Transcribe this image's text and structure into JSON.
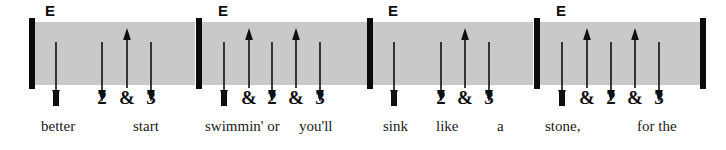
{
  "document": {
    "type": "strumming-pattern-notation",
    "width": 726,
    "height": 150,
    "band_color": "#c9c9c9",
    "ink_color": "#101010",
    "page_background": "#ffffff"
  },
  "measures": [
    {
      "id": "measure-1",
      "chord": "E",
      "chord_x": 45,
      "barline_x": 29,
      "band_start": 35,
      "band_end": 195,
      "strums": [
        {
          "beat_label": "1",
          "direction": "down",
          "x": 56,
          "is_downbeat_mark": true
        },
        {
          "beat_label": "2",
          "direction": "down",
          "x": 102,
          "is_downbeat_mark": false
        },
        {
          "beat_label": "&",
          "direction": "up",
          "x": 127,
          "is_downbeat_mark": false
        },
        {
          "beat_label": "3",
          "direction": "down",
          "x": 151,
          "is_downbeat_mark": false
        }
      ],
      "lyrics": [
        {
          "text": "better",
          "x": 41
        },
        {
          "text": "start",
          "x": 133
        }
      ]
    },
    {
      "id": "measure-2",
      "chord": "E",
      "chord_x": 218,
      "barline_x": 196,
      "band_start": 202,
      "band_end": 368,
      "strums": [
        {
          "beat_label": "1",
          "direction": "down",
          "x": 224,
          "is_downbeat_mark": true
        },
        {
          "beat_label": "&",
          "direction": "up",
          "x": 249,
          "is_downbeat_mark": false
        },
        {
          "beat_label": "2",
          "direction": "down",
          "x": 272,
          "is_downbeat_mark": false
        },
        {
          "beat_label": "&",
          "direction": "up",
          "x": 296,
          "is_downbeat_mark": false
        },
        {
          "beat_label": "3",
          "direction": "down",
          "x": 320,
          "is_downbeat_mark": false
        }
      ],
      "lyrics": [
        {
          "text": "swimmin' or",
          "x": 205
        },
        {
          "text": "you'll",
          "x": 299
        }
      ]
    },
    {
      "id": "measure-3",
      "chord": "E",
      "chord_x": 388,
      "barline_x": 367,
      "band_start": 373,
      "band_end": 533,
      "strums": [
        {
          "beat_label": "1",
          "direction": "down",
          "x": 394,
          "is_downbeat_mark": true
        },
        {
          "beat_label": "2",
          "direction": "down",
          "x": 441,
          "is_downbeat_mark": false
        },
        {
          "beat_label": "&",
          "direction": "up",
          "x": 465,
          "is_downbeat_mark": false
        },
        {
          "beat_label": "3",
          "direction": "down",
          "x": 489,
          "is_downbeat_mark": false
        }
      ],
      "lyrics": [
        {
          "text": "sink",
          "x": 383
        },
        {
          "text": "like",
          "x": 436
        },
        {
          "text": "a",
          "x": 497
        }
      ]
    },
    {
      "id": "measure-4",
      "chord": "E",
      "chord_x": 556,
      "barline_x": 534,
      "band_start": 540,
      "band_end": 700,
      "strums": [
        {
          "beat_label": "1",
          "direction": "down",
          "x": 562,
          "is_downbeat_mark": true
        },
        {
          "beat_label": "&",
          "direction": "up",
          "x": 587,
          "is_downbeat_mark": false
        },
        {
          "beat_label": "2",
          "direction": "down",
          "x": 611,
          "is_downbeat_mark": false
        },
        {
          "beat_label": "&",
          "direction": "up",
          "x": 635,
          "is_downbeat_mark": false
        },
        {
          "beat_label": "3",
          "direction": "down",
          "x": 659,
          "is_downbeat_mark": false
        }
      ],
      "lyrics": [
        {
          "text": "stone,",
          "x": 545
        },
        {
          "text": "for the",
          "x": 637
        }
      ]
    }
  ],
  "final_barline": {
    "x": 700
  }
}
